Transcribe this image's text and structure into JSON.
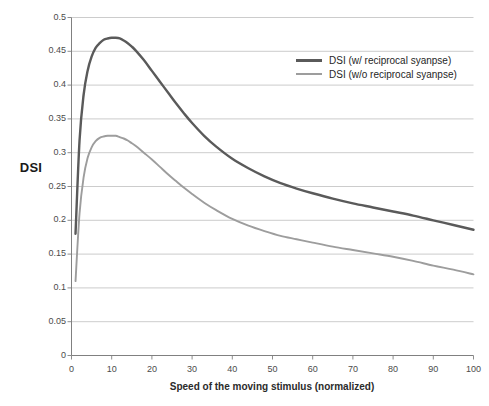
{
  "chart_data": {
    "type": "line",
    "title": "",
    "xlabel": "Speed of the moving stimulus (normalized)",
    "ylabel": "DSI",
    "xlim": [
      0,
      100
    ],
    "ylim": [
      0,
      0.5
    ],
    "xticks": [
      "0",
      "10",
      "20",
      "30",
      "40",
      "50",
      "60",
      "70",
      "80",
      "90",
      "100"
    ],
    "yticks": [
      "0",
      "0.05",
      "0.1",
      "0.15",
      "0.2",
      "0.25",
      "0.3",
      "0.35",
      "0.4",
      "0.45",
      "0.5"
    ],
    "grid": "horizontal",
    "legend_position": "upper-right-inside",
    "colors": {
      "series_0": "#5a5a5a",
      "series_1": "#9d9d9d",
      "grid": "#bfbfbf",
      "axis": "#808080",
      "text": "#404040"
    },
    "x": [
      1,
      2,
      3,
      4,
      5,
      6,
      7,
      8,
      9,
      10,
      11,
      12,
      13,
      14,
      15,
      16,
      18,
      20,
      22,
      24,
      26,
      28,
      30,
      33,
      36,
      40,
      44,
      48,
      52,
      56,
      60,
      65,
      70,
      75,
      80,
      85,
      90,
      95,
      100
    ],
    "series": [
      {
        "name": "DSI (w/ reciprocal syanpse)",
        "color": "#5a5a5a",
        "values": [
          0.18,
          0.318,
          0.385,
          0.421,
          0.442,
          0.455,
          0.462,
          0.467,
          0.469,
          0.47,
          0.47,
          0.469,
          0.466,
          0.462,
          0.457,
          0.451,
          0.437,
          0.421,
          0.405,
          0.389,
          0.373,
          0.358,
          0.344,
          0.325,
          0.309,
          0.291,
          0.277,
          0.265,
          0.255,
          0.247,
          0.24,
          0.232,
          0.225,
          0.219,
          0.213,
          0.207,
          0.2,
          0.193,
          0.186
        ]
      },
      {
        "name": "DSI (w/o reciprocal syanpse)",
        "color": "#9d9d9d",
        "values": [
          0.11,
          0.21,
          0.263,
          0.292,
          0.308,
          0.317,
          0.322,
          0.324,
          0.325,
          0.325,
          0.325,
          0.323,
          0.321,
          0.318,
          0.314,
          0.31,
          0.3,
          0.29,
          0.279,
          0.268,
          0.258,
          0.248,
          0.239,
          0.226,
          0.215,
          0.202,
          0.192,
          0.184,
          0.177,
          0.172,
          0.167,
          0.161,
          0.156,
          0.151,
          0.146,
          0.14,
          0.133,
          0.127,
          0.12
        ]
      }
    ]
  },
  "legend": {
    "items": [
      {
        "label": "DSI (w/ reciprocal syanpse)"
      },
      {
        "label": "DSI (w/o reciprocal syanpse)"
      }
    ]
  }
}
